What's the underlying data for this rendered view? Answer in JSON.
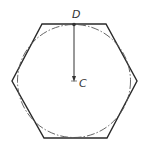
{
  "diagram": {
    "title": "",
    "labels": {
      "top_point": "D",
      "center_point": "C"
    },
    "shapes": {
      "hexagon": {
        "stroke": "#2a2a2a"
      },
      "inscribed_circle": {
        "style": "dash-dot",
        "stroke": "#555555"
      },
      "arrow": {
        "from": "D",
        "to": "C",
        "stroke": "#333333"
      }
    }
  }
}
